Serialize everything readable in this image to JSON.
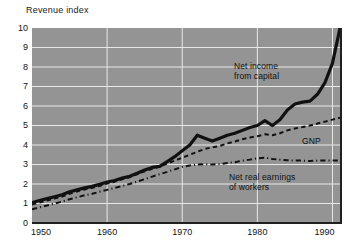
{
  "chart_data": {
    "type": "line",
    "title": "Revenue index",
    "xlabel": "",
    "ylabel": "Revenue index",
    "xlim": [
      1950,
      1991
    ],
    "ylim": [
      0,
      10
    ],
    "xticks": [
      "1950",
      "1960",
      "1970",
      "1980",
      "1990"
    ],
    "xtick_values": [
      1950,
      1960,
      1970,
      1980,
      1990
    ],
    "yticks": [
      "0",
      "1",
      "2",
      "3",
      "4",
      "5",
      "6",
      "7",
      "8",
      "9",
      "10"
    ],
    "ytick_values": [
      0,
      1,
      2,
      3,
      4,
      5,
      6,
      7,
      8,
      9,
      10
    ],
    "grid": true,
    "grid_color": "#e8e8e8",
    "plot_background": "#949494",
    "page_background": "#ffffff",
    "legend": "annotations-inline",
    "series": [
      {
        "name": "Net income from capital",
        "style": "solid",
        "color": "#111111",
        "width": 3.2,
        "x": [
          1950,
          1951,
          1952,
          1953,
          1954,
          1955,
          1956,
          1957,
          1958,
          1959,
          1960,
          1961,
          1962,
          1963,
          1964,
          1965,
          1966,
          1967,
          1968,
          1969,
          1970,
          1971,
          1972,
          1973,
          1974,
          1975,
          1976,
          1977,
          1978,
          1979,
          1980,
          1981,
          1982,
          1983,
          1984,
          1985,
          1986,
          1987,
          1988,
          1989,
          1990,
          1991
        ],
        "values": [
          1.05,
          1.15,
          1.25,
          1.35,
          1.45,
          1.6,
          1.7,
          1.8,
          1.88,
          1.98,
          2.1,
          2.18,
          2.3,
          2.4,
          2.55,
          2.72,
          2.85,
          2.9,
          3.15,
          3.4,
          3.7,
          4.0,
          4.5,
          4.35,
          4.2,
          4.35,
          4.5,
          4.6,
          4.75,
          4.9,
          5.0,
          5.25,
          5.0,
          5.3,
          5.8,
          6.1,
          6.2,
          6.25,
          6.6,
          7.2,
          8.2,
          10.0
        ]
      },
      {
        "name": "GNP",
        "style": "dashed",
        "color": "#111111",
        "width": 2.0,
        "x": [
          1950,
          1951,
          1952,
          1953,
          1954,
          1955,
          1956,
          1957,
          1958,
          1959,
          1960,
          1961,
          1962,
          1963,
          1964,
          1965,
          1966,
          1967,
          1968,
          1969,
          1970,
          1971,
          1972,
          1973,
          1974,
          1975,
          1976,
          1977,
          1978,
          1979,
          1980,
          1981,
          1982,
          1983,
          1984,
          1985,
          1986,
          1987,
          1988,
          1989,
          1990,
          1991
        ],
        "values": [
          0.95,
          1.05,
          1.15,
          1.25,
          1.35,
          1.5,
          1.62,
          1.72,
          1.8,
          1.9,
          2.02,
          2.12,
          2.24,
          2.35,
          2.5,
          2.65,
          2.78,
          2.9,
          3.05,
          3.2,
          3.35,
          3.5,
          3.65,
          3.8,
          3.88,
          3.95,
          4.08,
          4.18,
          4.3,
          4.38,
          4.45,
          4.55,
          4.5,
          4.6,
          4.75,
          4.85,
          4.92,
          5.0,
          5.1,
          5.2,
          5.3,
          5.4
        ]
      },
      {
        "name": "Net real earnings of workers",
        "style": "dash-dot",
        "color": "#111111",
        "width": 2.0,
        "x": [
          1950,
          1951,
          1952,
          1953,
          1954,
          1955,
          1956,
          1957,
          1958,
          1959,
          1960,
          1961,
          1962,
          1963,
          1964,
          1965,
          1966,
          1967,
          1968,
          1969,
          1970,
          1971,
          1972,
          1973,
          1974,
          1975,
          1976,
          1977,
          1978,
          1979,
          1980,
          1981,
          1982,
          1983,
          1984,
          1985,
          1986,
          1987,
          1988,
          1989,
          1990,
          1991
        ],
        "values": [
          0.7,
          0.8,
          0.9,
          1.0,
          1.1,
          1.22,
          1.32,
          1.42,
          1.5,
          1.6,
          1.7,
          1.8,
          1.9,
          2.0,
          2.12,
          2.25,
          2.38,
          2.5,
          2.62,
          2.75,
          2.88,
          2.95,
          3.0,
          3.02,
          3.0,
          3.02,
          3.08,
          3.12,
          3.2,
          3.25,
          3.32,
          3.35,
          3.28,
          3.25,
          3.22,
          3.2,
          3.2,
          3.18,
          3.2,
          3.2,
          3.2,
          3.2
        ]
      }
    ],
    "annotations": [
      {
        "name": "net-income-from-capital",
        "text": "Net income\nfrom capital",
        "x_px": 234,
        "y_px": 61
      },
      {
        "name": "gnp",
        "text": "GNP",
        "x_px": 302,
        "y_px": 136
      },
      {
        "name": "net-real-earnings-of-workers",
        "text": "Net real earnings\nof workers",
        "x_px": 229,
        "y_px": 172
      }
    ]
  }
}
